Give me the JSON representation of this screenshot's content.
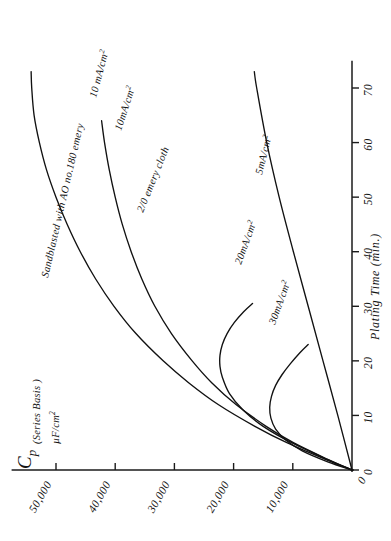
{
  "chart_data": {
    "type": "line",
    "title": "",
    "orientation": "rotated-90-ccw",
    "xlabel": "Plating Time (min.)",
    "ylabel": "Cp",
    "ylabel_sub1": "(Series Basis )",
    "ylabel_sub2": "µF/cm²",
    "xlim": [
      0,
      75
    ],
    "ylim": [
      0,
      55000
    ],
    "xticks": [
      0,
      10,
      20,
      30,
      40,
      50,
      60,
      70
    ],
    "xticklabels": [
      "0",
      "10",
      "20",
      "30",
      "40",
      "50",
      "60",
      "70"
    ],
    "yticks": [
      0,
      10000,
      20000,
      30000,
      40000,
      50000
    ],
    "yticklabels": [
      "0",
      "10,000",
      "20,000",
      "30,000",
      "40,000",
      "50,000"
    ],
    "grid": false,
    "legend": "inline-curve-labels",
    "annotations": [
      "Sandblasted with AO no.180 emery",
      "2/0 emery cloth"
    ],
    "series": [
      {
        "name": "10 mA/cm² (sandblasted with AO no.180 emery)",
        "label": "10 mA/cm²",
        "surface": "Sandblasted with AO no.180 emery",
        "points": [
          [
            0,
            0
          ],
          [
            2,
            4600
          ],
          [
            5,
            11000
          ],
          [
            8,
            16400
          ],
          [
            12,
            22600
          ],
          [
            16,
            27600
          ],
          [
            20,
            31900
          ],
          [
            25,
            36500
          ],
          [
            30,
            40200
          ],
          [
            35,
            43300
          ],
          [
            40,
            45900
          ],
          [
            45,
            48100
          ],
          [
            50,
            50000
          ],
          [
            55,
            51600
          ],
          [
            60,
            52800
          ],
          [
            65,
            53700
          ],
          [
            70,
            54100
          ],
          [
            73,
            54200
          ]
        ]
      },
      {
        "name": "10 mA/cm² (2/0 emery cloth)",
        "label": "10 mA/cm²",
        "surface": "2/0 emery cloth",
        "points": [
          [
            0,
            0
          ],
          [
            2,
            4200
          ],
          [
            5,
            9900
          ],
          [
            8,
            14500
          ],
          [
            12,
            19600
          ],
          [
            16,
            23700
          ],
          [
            20,
            27000
          ],
          [
            25,
            30500
          ],
          [
            30,
            33300
          ],
          [
            35,
            35500
          ],
          [
            40,
            37300
          ],
          [
            45,
            38800
          ],
          [
            50,
            40000
          ],
          [
            55,
            41000
          ],
          [
            60,
            41800
          ],
          [
            64,
            42300
          ]
        ]
      },
      {
        "name": "20 mA/cm²",
        "label": "20mA/cm²",
        "points": [
          [
            0,
            0
          ],
          [
            2,
            4300
          ],
          [
            5,
            10200
          ],
          [
            8,
            15000
          ],
          [
            11,
            18400
          ],
          [
            14,
            20700
          ],
          [
            17,
            21900
          ],
          [
            19,
            22300
          ],
          [
            21,
            22300
          ],
          [
            23,
            21900
          ],
          [
            25,
            21100
          ],
          [
            27,
            19900
          ],
          [
            29,
            18300
          ],
          [
            30.5,
            16800
          ]
        ]
      },
      {
        "name": "30 mA/cm²",
        "label": "30mA/cm²",
        "points": [
          [
            0,
            0
          ],
          [
            1.5,
            4100
          ],
          [
            3.5,
            8400
          ],
          [
            5.5,
            11200
          ],
          [
            7.5,
            12900
          ],
          [
            9.5,
            13700
          ],
          [
            11.5,
            13900
          ],
          [
            13.5,
            13600
          ],
          [
            15.5,
            12900
          ],
          [
            17.5,
            11800
          ],
          [
            19.5,
            10400
          ],
          [
            21.5,
            8800
          ],
          [
            23,
            7400
          ]
        ]
      },
      {
        "name": "5 mA/cm²",
        "label": "5mA/cm²",
        "points": [
          [
            0,
            0
          ],
          [
            10,
            2400
          ],
          [
            20,
            4900
          ],
          [
            30,
            7400
          ],
          [
            40,
            9900
          ],
          [
            50,
            12300
          ],
          [
            60,
            14400
          ],
          [
            70,
            16100
          ],
          [
            73,
            16500
          ]
        ]
      }
    ]
  },
  "labels": {
    "cp": "C",
    "cp_sub": "p",
    "series_basis": "(Series Basis )",
    "micro_f": "µF/cm",
    "micro_f_sup": "2",
    "plating_time": "Plating Time (min.)",
    "ma_cm2_10_a": "10 mA/cm",
    "ma_cm2_10_b": "10mA/cm",
    "ma_cm2_20": "20mA/cm",
    "ma_cm2_30": "30mA/cm",
    "ma_cm2_5": "5mA/cm",
    "sup2": "2",
    "sandblasted": "Sandblasted with AO no.180 emery",
    "emery_cloth": "2/0 emery cloth"
  }
}
